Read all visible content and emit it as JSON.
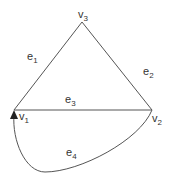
{
  "graph": {
    "vertices": [
      {
        "id": "v1",
        "base": "v",
        "sub": "1",
        "x": 14,
        "y": 110
      },
      {
        "id": "v2",
        "base": "v",
        "sub": "2",
        "x": 152,
        "y": 110
      },
      {
        "id": "v3",
        "base": "v",
        "sub": "3",
        "x": 82,
        "y": 22
      }
    ],
    "edges": [
      {
        "id": "e1",
        "base": "e",
        "sub": "1",
        "from": "v1",
        "to": "v3"
      },
      {
        "id": "e2",
        "base": "e",
        "sub": "2",
        "from": "v3",
        "to": "v2"
      },
      {
        "id": "e3",
        "base": "e",
        "sub": "3",
        "from": "v1",
        "to": "v2"
      },
      {
        "id": "e4",
        "base": "e",
        "sub": "4",
        "from": "v2",
        "to": "v1",
        "directed": true
      }
    ]
  }
}
